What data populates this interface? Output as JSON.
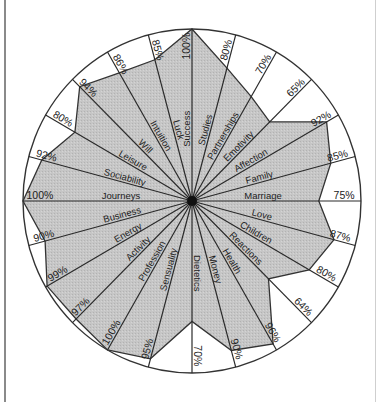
{
  "chart_data": {
    "type": "radar",
    "title": "",
    "start_angle_deg": 0,
    "direction": "clockwise",
    "max_value": 100,
    "unit": "%",
    "fill_color": "#c4c4c4",
    "line_color": "#333333",
    "categories": [
      "Success",
      "Studies",
      "Partnerships",
      "Emotivity",
      "Affection",
      "Family",
      "Marriage",
      "Love",
      "Children",
      "Reactions",
      "Health",
      "Money",
      "Dietetics",
      "Sensuality",
      "Profession",
      "Activity",
      "Energy",
      "Business",
      "Journeys",
      "Sociability",
      "Leisure",
      "Will",
      "Intuition",
      "Luck"
    ],
    "values": [
      100,
      80,
      70,
      65,
      92,
      85,
      75,
      87,
      80,
      64,
      96,
      90,
      70,
      95,
      100,
      97,
      99,
      90,
      100,
      92,
      80,
      94,
      86,
      85
    ],
    "value_labels": [
      "100%",
      "80%",
      "70%",
      "65%",
      "92%",
      "85%",
      "75%",
      "87%",
      "80%",
      "64%",
      "96%",
      "90%",
      "70%",
      "95%",
      "100%",
      "97%",
      "99%",
      "90%",
      "100%",
      "92%",
      "80%",
      "94%",
      "86%",
      "85%"
    ]
  }
}
